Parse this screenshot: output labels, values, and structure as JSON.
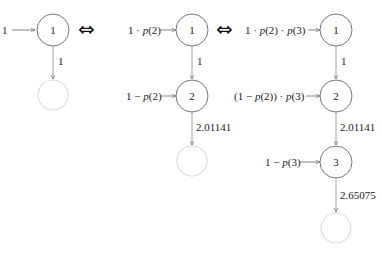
{
  "diagrams": [
    {
      "id": "chain-1",
      "input_label": "1",
      "nodes": [
        {
          "label": "1"
        }
      ],
      "edges": [
        {
          "label": "1"
        }
      ],
      "terminal": "empty"
    },
    {
      "id": "chain-2",
      "inputs": [
        "1 · p(2)",
        "1 − p(2)"
      ],
      "nodes": [
        {
          "label": "1"
        },
        {
          "label": "2"
        }
      ],
      "edges": [
        {
          "label": "1"
        },
        {
          "label": "2.01141"
        }
      ],
      "terminal": "empty"
    },
    {
      "id": "chain-3",
      "inputs": [
        "1 · p(2) · p(3)",
        "(1 − p(2)) · p(3)",
        "1 − p(3)"
      ],
      "nodes": [
        {
          "label": "1"
        },
        {
          "label": "2"
        },
        {
          "label": "3"
        }
      ],
      "edges": [
        {
          "label": "1"
        },
        {
          "label": "2.01141"
        },
        {
          "label": "2.65075"
        }
      ],
      "terminal": "empty"
    }
  ],
  "equivalence_symbol": "⇔",
  "colors": {
    "node_stroke": "#777777",
    "terminal_stroke": "#dddddd",
    "edge": "#888888",
    "text": "#222222"
  }
}
